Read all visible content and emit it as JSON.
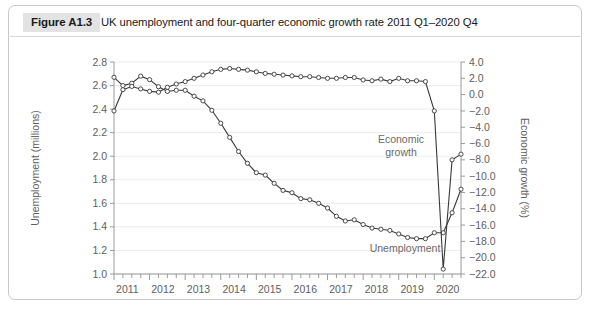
{
  "figure": {
    "badge": "Figure A1.3",
    "title": "UK unemployment and four-quarter economic growth rate 2011 Q1–2020 Q4"
  },
  "chart_data": {
    "type": "line",
    "title": "UK unemployment and four-quarter economic growth rate 2011 Q1–2020 Q4",
    "xlabel": "",
    "ylabel": "Unemployment (millions)",
    "y2label": "Economic growth (%)",
    "ylim": [
      1.0,
      2.8
    ],
    "y2lim": [
      -22.0,
      4.0
    ],
    "grid": true,
    "legend_position": "inline-annotations",
    "x_tick_labels": [
      "2011",
      "2012",
      "2013",
      "2014",
      "2015",
      "2016",
      "2017",
      "2018",
      "2019",
      "2020"
    ],
    "y_tick_labels": [
      "1.0",
      "1.2",
      "1.4",
      "1.6",
      "1.8",
      "2.0",
      "2.2",
      "2.4",
      "2.6",
      "2.8"
    ],
    "y2_tick_labels": [
      "−22.0",
      "−20.0",
      "−18.0",
      "−16.0",
      "−14.0",
      "−12.0",
      "−10.0",
      "−8.0",
      "−6.0",
      "−4.0",
      "−2.0",
      "0.0",
      "2.0",
      "4.0"
    ],
    "x_quarters": [
      "2011 Q1",
      "2011 Q2",
      "2011 Q3",
      "2011 Q4",
      "2012 Q1",
      "2012 Q2",
      "2012 Q3",
      "2012 Q4",
      "2013 Q1",
      "2013 Q2",
      "2013 Q3",
      "2013 Q4",
      "2014 Q1",
      "2014 Q2",
      "2014 Q3",
      "2014 Q4",
      "2015 Q1",
      "2015 Q2",
      "2015 Q3",
      "2015 Q4",
      "2016 Q1",
      "2016 Q2",
      "2016 Q3",
      "2016 Q4",
      "2017 Q1",
      "2017 Q2",
      "2017 Q3",
      "2017 Q4",
      "2018 Q1",
      "2018 Q2",
      "2018 Q3",
      "2018 Q4",
      "2019 Q1",
      "2019 Q2",
      "2019 Q3",
      "2019 Q4",
      "2020 Q1",
      "2020 Q2",
      "2020 Q3",
      "2020 Q4"
    ],
    "series": [
      {
        "name": "Unemployment",
        "axis": "left",
        "units": "millions",
        "annotation": "Unemployment",
        "values": [
          2.67,
          2.6,
          2.62,
          2.68,
          2.65,
          2.59,
          2.55,
          2.56,
          2.56,
          2.51,
          2.47,
          2.39,
          2.28,
          2.16,
          2.04,
          1.94,
          1.86,
          1.84,
          1.77,
          1.71,
          1.69,
          1.64,
          1.63,
          1.6,
          1.56,
          1.49,
          1.45,
          1.46,
          1.42,
          1.39,
          1.38,
          1.37,
          1.34,
          1.31,
          1.3,
          1.3,
          1.35,
          1.35,
          1.52,
          1.72
        ]
      },
      {
        "name": "Economic growth",
        "axis": "right",
        "units": "%",
        "annotation": "Economic growth",
        "values": [
          -2.0,
          0.6,
          1.0,
          0.7,
          0.4,
          0.3,
          0.9,
          1.3,
          1.6,
          2.0,
          2.4,
          2.8,
          3.1,
          3.2,
          3.1,
          3.0,
          2.8,
          2.6,
          2.5,
          2.4,
          2.3,
          2.2,
          2.2,
          2.1,
          2.0,
          2.0,
          2.1,
          2.1,
          1.8,
          1.7,
          1.9,
          1.6,
          2.0,
          1.7,
          1.7,
          1.6,
          -2.0,
          -21.4,
          -8.0,
          -7.3
        ]
      }
    ]
  }
}
